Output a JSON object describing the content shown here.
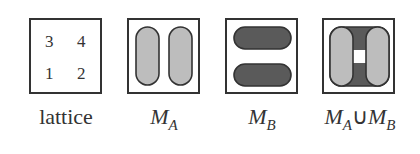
{
  "figure": {
    "panels": [
      {
        "id": "lattice",
        "caption": "lattice",
        "cells": [
          "3",
          "4",
          "1",
          "2"
        ]
      },
      {
        "id": "MA",
        "caption_main": "M",
        "caption_sub": "A",
        "shape": "two vertical rounded bars",
        "fill": "#bdbdbd"
      },
      {
        "id": "MB",
        "caption_main": "M",
        "caption_sub": "B",
        "shape": "two horizontal rounded bars",
        "fill": "#5a5a5a"
      },
      {
        "id": "MAuMB",
        "caption_a": "M",
        "caption_a_sub": "A",
        "union": "∪",
        "caption_b": "M",
        "caption_b_sub": "B",
        "shape": "union of vertical and horizontal bars"
      }
    ],
    "colors": {
      "light_fill": "#bdbdbd",
      "dark_fill": "#5a5a5a",
      "stroke": "#333333"
    }
  }
}
